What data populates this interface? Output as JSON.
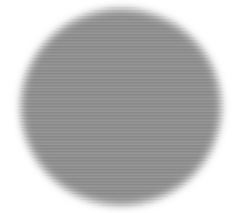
{
  "image": {
    "title": "Soft-edged gray circular disc on white background",
    "width": 242,
    "height": 213,
    "background_color": "#ffffff",
    "subject": "gray-disc"
  },
  "disc": {
    "label": "gray circular disc",
    "fill_color": "#8e8e8e",
    "center_x": 118,
    "center_y": 104,
    "radius_x": 96,
    "radius_y": 93,
    "edge": "blurred-feathered",
    "edge_width_px": 18,
    "interior": "uniform flat gray, no gradient"
  },
  "halo": {
    "label": "bright halo ring outside disc",
    "color": "#ffffff",
    "visible_arcs": "left and top-left strongest"
  },
  "texture": {
    "label": "horizontal scan-line banding",
    "orientation": "horizontal",
    "period_px": 2,
    "strength": "faint"
  }
}
